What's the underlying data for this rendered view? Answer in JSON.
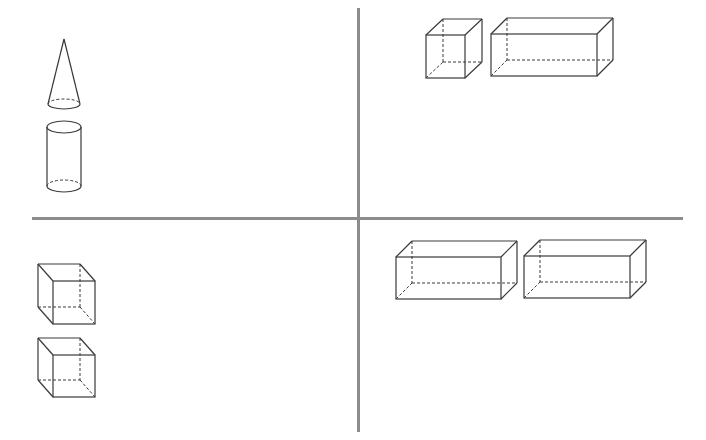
{
  "figure": {
    "line_color": "#3a3a3a",
    "divider_color": "#8c8c8c",
    "quadrants": [
      {
        "position": "top-left",
        "shapes": [
          {
            "type": "cone",
            "apex": [
              64,
              39
            ],
            "base_center": [
              64,
              104
            ],
            "rx": 16,
            "ry": 5
          },
          {
            "type": "cylinder",
            "top_center": [
              64,
              127
            ],
            "bottom_center": [
              64,
              186
            ],
            "rx": 17,
            "ry": 6
          }
        ]
      },
      {
        "position": "top-right",
        "shapes": [
          {
            "type": "cube",
            "front": [
              426,
              35,
              465,
              78
            ],
            "offset": [
              17,
              -16
            ]
          },
          {
            "type": "rectangular-prism",
            "front": [
              491,
              34,
              597,
              76
            ],
            "offset": [
              16,
              -16
            ]
          }
        ]
      },
      {
        "position": "bottom-left",
        "shapes": [
          {
            "type": "cube",
            "back": [
              38,
              264,
              80,
              307
            ],
            "offset": [
              15,
              17
            ]
          },
          {
            "type": "cube",
            "back": [
              38,
              338,
              80,
              380
            ],
            "offset": [
              15,
              17
            ]
          }
        ]
      },
      {
        "position": "bottom-right",
        "shapes": [
          {
            "type": "rectangular-prism",
            "front": [
              396,
              257,
              501,
              299
            ],
            "offset": [
              16,
              -16
            ]
          },
          {
            "type": "rectangular-prism",
            "front": [
              524,
              256,
              630,
              298
            ],
            "offset": [
              16,
              -16
            ]
          }
        ]
      }
    ]
  }
}
